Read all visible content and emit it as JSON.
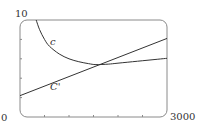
{
  "chart_data": {
    "type": "line",
    "title": "",
    "xlabel": "",
    "ylabel": "",
    "xlim": [
      0,
      3000
    ],
    "ylim": [
      0,
      10
    ],
    "grid": false,
    "legend": "none (curves labeled inline)",
    "x_tick_labels": [
      "0",
      "3000"
    ],
    "y_tick_labels": [
      "10"
    ],
    "x_minor_ticks": [
      500,
      1000,
      1500,
      2000,
      2500
    ],
    "y_minor_ticks": [
      2,
      4,
      6,
      8
    ],
    "series": [
      {
        "name": "c",
        "label": "c",
        "description": "average cost curve, decreasing then slowly increasing",
        "x": [
          330,
          400,
          500,
          600,
          800,
          1000,
          1200,
          1400,
          1550,
          1800,
          2000,
          2400,
          2800,
          3000
        ],
        "y": [
          10.0,
          9.0,
          8.0,
          7.3,
          6.5,
          6.0,
          5.7,
          5.5,
          5.4,
          5.45,
          5.55,
          5.75,
          5.95,
          6.05
        ]
      },
      {
        "name": "C'",
        "label": "C'",
        "description": "marginal cost line, increasing linearly",
        "x": [
          0,
          1000,
          1550,
          2000,
          3000
        ],
        "y": [
          2.2,
          4.2,
          5.4,
          6.1,
          8.1
        ]
      }
    ],
    "annotations": [
      {
        "text": "c",
        "x": 650,
        "y": 8.2
      },
      {
        "text": "C'",
        "x": 900,
        "y": 3.4
      }
    ],
    "intersection": {
      "x": 1550,
      "y": 5.4
    }
  },
  "labels": {
    "y_max": "10",
    "x_min": "0",
    "x_max": "3000",
    "curve_c": "c",
    "curve_Cprime": "C'"
  },
  "colors": {
    "frame": "#8a8a8a",
    "curve": "#333333",
    "background": "#ffffff"
  }
}
